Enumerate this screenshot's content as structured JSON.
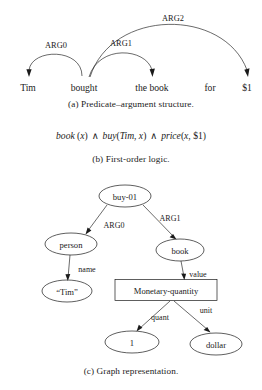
{
  "figure": {
    "panel_a": {
      "caption": "(a) Predicate–argument structure.",
      "words": [
        {
          "text": "Tim",
          "x": 28
        },
        {
          "text": "bought",
          "x": 84
        },
        {
          "text": "the book",
          "x": 152
        },
        {
          "text": "for",
          "x": 210
        },
        {
          "text": "$1",
          "x": 247
        }
      ],
      "arcs": [
        {
          "label": "ARG0",
          "from": "bought",
          "to": "Tim",
          "label_x": 56,
          "label_y": 48
        },
        {
          "label": "ARG1",
          "from": "bought",
          "to": "the book",
          "label_x": 120,
          "label_y": 46
        },
        {
          "label": "ARG2",
          "from": "bought",
          "to": "$1",
          "label_x": 172,
          "label_y": 20
        }
      ]
    },
    "panel_b": {
      "caption": "(b) First-order logic.",
      "formula_plain": "book (x) ∧ buy(Tim, x) ∧ price(x, $1)",
      "formula_parts": [
        {
          "kind": "italic",
          "text": "book"
        },
        {
          "kind": "roman",
          "text": " ("
        },
        {
          "kind": "italic",
          "text": "x"
        },
        {
          "kind": "roman",
          "text": ") "
        },
        {
          "kind": "and",
          "text": "∧"
        },
        {
          "kind": "roman",
          "text": " "
        },
        {
          "kind": "italic",
          "text": "buy"
        },
        {
          "kind": "roman",
          "text": "("
        },
        {
          "kind": "italic",
          "text": "Tim"
        },
        {
          "kind": "roman",
          "text": ", "
        },
        {
          "kind": "italic",
          "text": "x"
        },
        {
          "kind": "roman",
          "text": ") "
        },
        {
          "kind": "and",
          "text": "∧"
        },
        {
          "kind": "roman",
          "text": " "
        },
        {
          "kind": "italic",
          "text": "price"
        },
        {
          "kind": "roman",
          "text": "("
        },
        {
          "kind": "italic",
          "text": "x"
        },
        {
          "kind": "roman",
          "text": ", $1)"
        }
      ]
    },
    "panel_c": {
      "caption": "(c) Graph representation.",
      "nodes": [
        {
          "id": "buy01",
          "label": "buy-01",
          "shape": "ellipse",
          "cx": 125,
          "cy": 24,
          "rx": 26,
          "ry": 11
        },
        {
          "id": "person",
          "label": "person",
          "shape": "ellipse",
          "cx": 71,
          "cy": 72,
          "rx": 26,
          "ry": 11
        },
        {
          "id": "book",
          "label": "book",
          "shape": "ellipse",
          "cx": 180,
          "cy": 78,
          "rx": 24,
          "ry": 11
        },
        {
          "id": "tim",
          "label": "“Tim”",
          "shape": "ellipse",
          "cx": 67,
          "cy": 119,
          "rx": 25,
          "ry": 11
        },
        {
          "id": "monqty",
          "label": "Monetary-quantity",
          "shape": "rect",
          "cx": 166,
          "cy": 118,
          "w": 102,
          "h": 21
        },
        {
          "id": "one",
          "label": "1",
          "shape": "ellipse",
          "cx": 132,
          "cy": 170,
          "rx": 27,
          "ry": 11
        },
        {
          "id": "dollar",
          "label": "dollar",
          "shape": "ellipse",
          "cx": 216,
          "cy": 172,
          "rx": 26,
          "ry": 11
        }
      ],
      "edges": [
        {
          "label": "ARG0",
          "from": "buy01",
          "to": "person",
          "label_x": 113,
          "label_y": 54
        },
        {
          "label": "ARG1",
          "from": "buy01",
          "to": "book",
          "label_x": 168,
          "label_y": 47
        },
        {
          "label": "name",
          "from": "person",
          "to": "tim",
          "label_x": 86,
          "label_y": 98
        },
        {
          "label": "value",
          "from": "book",
          "to": "monqty",
          "label_x": 196,
          "label_y": 103
        },
        {
          "label": "quant",
          "from": "monqty",
          "to": "one",
          "label_x": 159,
          "label_y": 146
        },
        {
          "label": "unit",
          "from": "monqty",
          "to": "dollar",
          "label_x": 205,
          "label_y": 139
        }
      ]
    }
  },
  "colors": {
    "ink": "#1a1a1a",
    "background": "#ffffff"
  }
}
